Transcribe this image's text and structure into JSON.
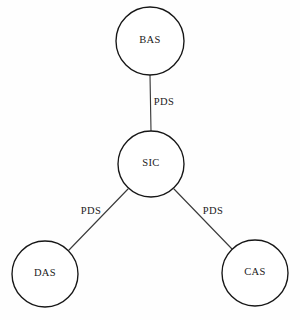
{
  "diagram": {
    "type": "node-link-graph",
    "layout": "star",
    "background_color": "#fefefe",
    "node_stroke_color": "#161616",
    "node_fill_color": "#ffffff",
    "edge_stroke_color": "#3b3b3b",
    "label_color": "#1a1a1a",
    "nodes": [
      {
        "id": "bas",
        "label": "BAS",
        "cx": 150,
        "cy": 41,
        "r": 34
      },
      {
        "id": "sic",
        "label": "SIC",
        "cx": 151,
        "cy": 164,
        "r": 33
      },
      {
        "id": "das",
        "label": "DAS",
        "cx": 45,
        "cy": 274,
        "r": 33
      },
      {
        "id": "cas",
        "label": "CAS",
        "cx": 255,
        "cy": 273,
        "r": 33
      }
    ],
    "edges": [
      {
        "id": "sic-bas",
        "source": "sic",
        "target": "bas",
        "label": "PDS",
        "x1": 150,
        "y1": 75,
        "x2": 151,
        "y2": 131,
        "label_x": 164,
        "label_y": 103
      },
      {
        "id": "sic-das",
        "source": "sic",
        "target": "das",
        "label": "PDS",
        "x1": 128,
        "y1": 189,
        "x2": 69,
        "y2": 250,
        "label_x": 91,
        "label_y": 212
      },
      {
        "id": "sic-cas",
        "source": "sic",
        "target": "cas",
        "label": "PDS",
        "x1": 174,
        "y1": 189,
        "x2": 232,
        "y2": 249,
        "label_x": 213,
        "label_y": 212
      }
    ]
  }
}
